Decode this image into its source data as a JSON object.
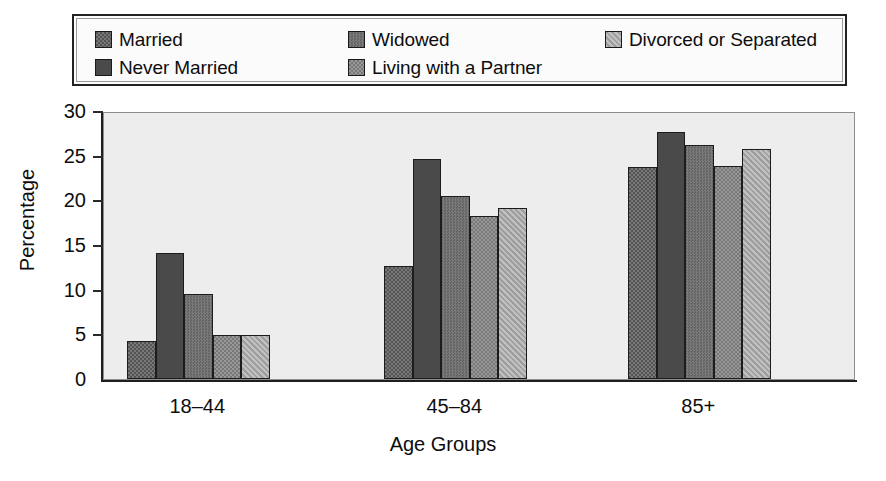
{
  "legend": {
    "entries": [
      {
        "label": "Married",
        "color": "#5e5e5e",
        "pattern": "checker"
      },
      {
        "label": "Never Married",
        "color": "#4a4a4a",
        "pattern": "solid"
      },
      {
        "label": "Widowed",
        "color": "#6b6b6b",
        "pattern": "fine"
      },
      {
        "label": "Living with a Partner",
        "color": "#848484",
        "pattern": "checker"
      },
      {
        "label": "Divorced or Separated",
        "color": "#a8a8a8",
        "pattern": "diagonal"
      }
    ]
  },
  "chart_data": {
    "type": "bar",
    "title": "",
    "xlabel": "Age Groups",
    "ylabel": "Percentage",
    "categories": [
      "18–44",
      "45–84",
      "85+"
    ],
    "ylim": [
      0,
      30
    ],
    "yticks": [
      0,
      5,
      10,
      15,
      20,
      25,
      30
    ],
    "ytick_labels": [
      "0",
      "5",
      "10",
      "15",
      "20",
      "25",
      "30"
    ],
    "grid": false,
    "legend_position": "top",
    "series": [
      {
        "name": "Married",
        "values": [
          4.2,
          12.7,
          23.7
        ]
      },
      {
        "name": "Never Married",
        "values": [
          14.1,
          24.6,
          27.7
        ]
      },
      {
        "name": "Widowed",
        "values": [
          9.5,
          20.5,
          26.2
        ]
      },
      {
        "name": "Living with a Partner",
        "values": [
          4.9,
          18.3,
          23.8
        ]
      },
      {
        "name": "Divorced or Separated",
        "values": [
          4.9,
          19.1,
          25.7
        ]
      }
    ]
  }
}
